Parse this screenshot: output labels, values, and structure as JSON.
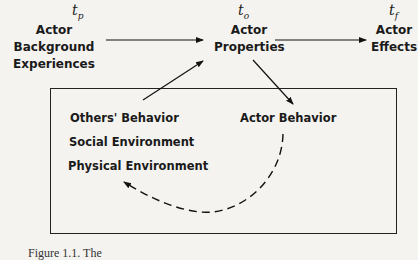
{
  "diagram": {
    "time_labels": {
      "past": {
        "base": "t",
        "sub": "p"
      },
      "present": {
        "base": "t",
        "sub": "o"
      },
      "future": {
        "base": "t",
        "sub": "f"
      }
    },
    "nodes": {
      "background": {
        "line1": "Actor Background",
        "line2": "Experiences"
      },
      "properties": {
        "line1": "Actor",
        "line2": "Properties"
      },
      "effects": {
        "line1": "Actor",
        "line2": "Effects"
      },
      "actor_behavior": "Actor Behavior"
    },
    "environment_box": {
      "items": [
        "Others' Behavior",
        "Social Environment",
        "Physical Environment"
      ]
    },
    "edges": [
      {
        "from": "Actor Background Experiences",
        "to": "Actor Properties",
        "style": "solid"
      },
      {
        "from": "Actor Properties",
        "to": "Actor Effects",
        "style": "solid"
      },
      {
        "from": "Actor Properties",
        "to": "Actor Behavior",
        "style": "solid"
      },
      {
        "from": "Environment box",
        "to": "Actor Properties",
        "style": "solid"
      },
      {
        "from": "Actor Behavior",
        "to": "Physical Environment",
        "style": "dashed-curve"
      }
    ],
    "caption": "Figure 1.1. The"
  }
}
